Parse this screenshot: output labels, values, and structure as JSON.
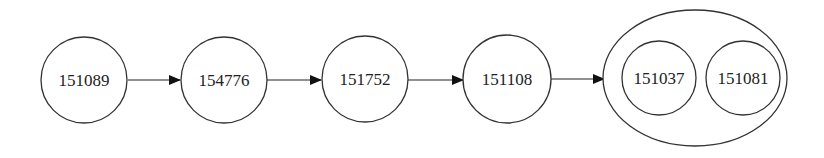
{
  "diagram": {
    "type": "flow",
    "nodes": [
      {
        "id": "n1",
        "label": "151089"
      },
      {
        "id": "n2",
        "label": "154776"
      },
      {
        "id": "n3",
        "label": "151752"
      },
      {
        "id": "n4",
        "label": "151108"
      }
    ],
    "group": {
      "id": "g1",
      "members": [
        {
          "id": "m1",
          "label": "151037"
        },
        {
          "id": "m2",
          "label": "151081"
        }
      ]
    },
    "edges": [
      {
        "from": "151089",
        "to": "154776"
      },
      {
        "from": "154776",
        "to": "151752"
      },
      {
        "from": "151752",
        "to": "151108"
      },
      {
        "from": "151108",
        "to": "group(151037, 151081)"
      }
    ]
  }
}
